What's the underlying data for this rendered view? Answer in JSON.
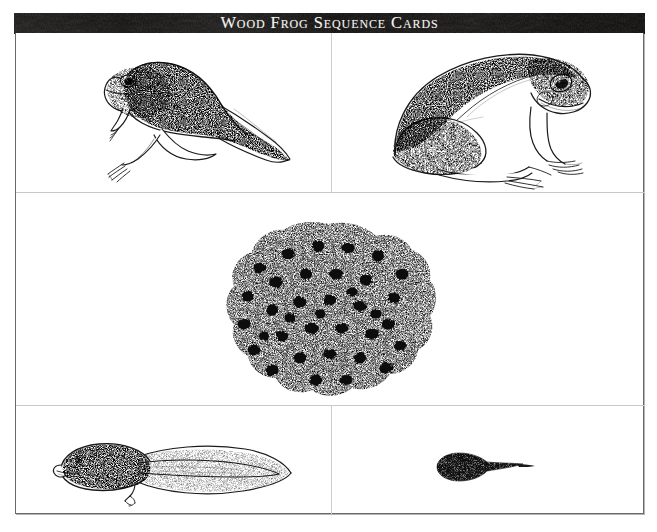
{
  "document": {
    "title": "Wood Frog Sequence Cards",
    "banner_title": "Wood Frog Sequence Cards",
    "banner_color": "#100f0e",
    "banner_text_color": "#f4f2ef",
    "page_background": "#ffffff",
    "frame_border_color": "#6a6a6a",
    "rule_color": "#c9c9c9",
    "ink_color": "#1a1a1a"
  },
  "layout": {
    "rows": 3,
    "row1_columns": 2,
    "row2_columns": 1,
    "row3_columns": 2,
    "total_cards": 5
  },
  "cards": [
    {
      "id": "card-froglet",
      "position": "row1-col1",
      "icon": "froglet-with-tail-illustration",
      "subject": "Froglet with four legs and remaining tail",
      "caption": ""
    },
    {
      "id": "card-adult-frog",
      "position": "row1-col2",
      "icon": "adult-wood-frog-illustration",
      "subject": "Adult wood frog in sitting profile",
      "caption": ""
    },
    {
      "id": "card-egg-mass",
      "position": "row2-full-width",
      "icon": "frog-egg-mass-illustration",
      "subject": "Gelatinous egg mass with dark embryos",
      "caption": ""
    },
    {
      "id": "card-tadpole",
      "position": "row3-col1",
      "icon": "large-tadpole-illustration",
      "subject": "Large tadpole with emerging hind leg",
      "caption": ""
    },
    {
      "id": "card-hatchling",
      "position": "row3-col2",
      "icon": "newly-hatched-tadpole-illustration",
      "subject": "Small newly hatched dark tadpole",
      "caption": ""
    }
  ]
}
